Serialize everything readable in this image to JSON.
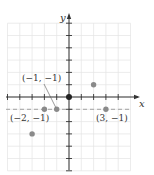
{
  "chart_data": {
    "type": "scatter",
    "title": "",
    "xlabel": "x",
    "ylabel": "y",
    "xlim": [
      -5,
      6
    ],
    "ylim": [
      -6,
      7
    ],
    "grid": true,
    "points": [
      {
        "x": 0,
        "y": 0,
        "label": ""
      },
      {
        "x": 2,
        "y": 1,
        "label": ""
      },
      {
        "x": 3,
        "y": -1,
        "label": "(3, −1)"
      },
      {
        "x": -1,
        "y": -1,
        "label": "(−1, −1)"
      },
      {
        "x": -2,
        "y": -1,
        "label": "(−2, −1)"
      },
      {
        "x": -3,
        "y": -3,
        "label": ""
      }
    ],
    "reference_lines": [
      {
        "type": "horizontal",
        "y": -1,
        "style": "dashed"
      }
    ],
    "colors": {
      "axis": "#333333",
      "grid": "#e4e4e4",
      "point": "#8a8a8a",
      "dashed": "#9a9a9a"
    }
  }
}
